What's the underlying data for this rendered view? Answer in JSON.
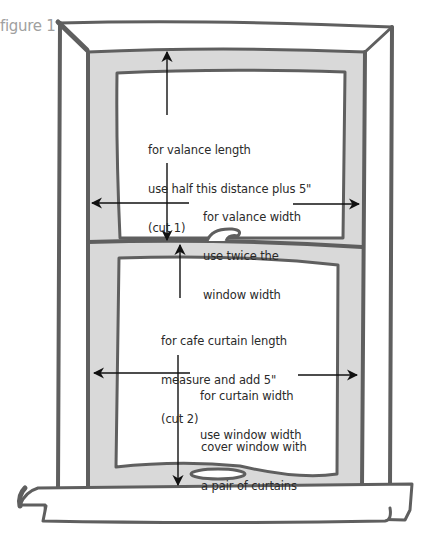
{
  "figure_label": "figure 1",
  "colors": {
    "frame_stroke": "#5f5f5f",
    "sash_fill": "#d9d9d9",
    "glass_fill": "#ffffff",
    "arrow": "#111111",
    "text": "#2a2a2a",
    "label": "#a0a0a0"
  },
  "annotations": {
    "valance_length": {
      "lines": [
        "for valance length",
        "use half this distance plus 5\"",
        "(cut 1)"
      ]
    },
    "valance_width": {
      "lines": [
        "for valance width",
        "use twice the",
        "window width"
      ]
    },
    "cafe_curtain_length": {
      "lines": [
        "for cafe curtain length",
        "measure and add 5\"",
        "(cut 2)"
      ]
    },
    "curtain_width": {
      "lines": [
        "for curtain width",
        "use window width"
      ]
    },
    "cover_window": {
      "lines": [
        "cover window with",
        "a pair of curtains"
      ]
    }
  }
}
